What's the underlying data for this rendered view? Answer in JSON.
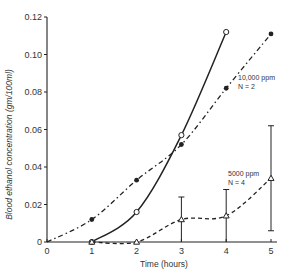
{
  "chart_data": {
    "type": "line",
    "title": "",
    "xlabel": "Time (hours)",
    "ylabel": "Blood ethanol concentration (gm/100ml)",
    "xlim": [
      0,
      5
    ],
    "ylim": [
      0,
      0.12
    ],
    "x_ticks": [
      "0",
      "1",
      "2",
      "3",
      "4",
      "5"
    ],
    "y_ticks": [
      "0",
      "0.02",
      "0.04",
      "0.06",
      "0.08",
      "0.10",
      "0.12"
    ],
    "grid": false,
    "series": [
      {
        "name": "solid-open-circle",
        "style": "solid",
        "marker": "open-circle",
        "x": [
          1,
          2,
          3,
          4
        ],
        "values": [
          0.0,
          0.016,
          0.057,
          0.112
        ]
      },
      {
        "name": "10,000 ppm N=2",
        "style": "dash-dot",
        "marker": "filled-circle",
        "x": [
          0,
          1,
          2,
          3,
          4,
          5
        ],
        "values": [
          0.0,
          0.012,
          0.033,
          0.052,
          0.082,
          0.111
        ]
      },
      {
        "name": "5000 ppm N=4",
        "style": "dashed",
        "marker": "open-triangle",
        "x": [
          1,
          2,
          3,
          4,
          5
        ],
        "values": [
          0.0,
          0.0,
          0.012,
          0.014,
          0.034
        ],
        "error_high": [
          0.002,
          0.001,
          0.024,
          0.028,
          0.062
        ],
        "error_low": [
          0.0,
          0.0,
          0.0,
          0.0,
          0.006
        ]
      }
    ],
    "annotations": [
      {
        "text_line1": "10,000 ppm",
        "text_line2": "N = 2",
        "series": "10,000 ppm N=2"
      },
      {
        "text_line1": "5000 ppm",
        "text_line2": "N = 4",
        "series": "5000 ppm N=4"
      }
    ]
  }
}
